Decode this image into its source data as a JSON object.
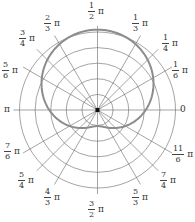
{
  "diagram": {
    "type": "polar-plot",
    "center": [
      97.5,
      110
    ],
    "ring_count": 5,
    "outer_radius_px": 78,
    "curve_color": "#8c8c8c",
    "grid_color": "#555555",
    "curve": "r = 3 + 2 sin θ"
  },
  "labels": {
    "a0": {
      "plain": "0"
    },
    "a1": {
      "num": "1",
      "den": "6",
      "pi": "π"
    },
    "a2": {
      "num": "1",
      "den": "4",
      "pi": "π"
    },
    "a3": {
      "num": "1",
      "den": "3",
      "pi": "π"
    },
    "a4": {
      "num": "1",
      "den": "2",
      "pi": "π"
    },
    "a5": {
      "num": "2",
      "den": "3",
      "pi": "π"
    },
    "a6": {
      "num": "3",
      "den": "4",
      "pi": "π"
    },
    "a7": {
      "num": "5",
      "den": "6",
      "pi": "π"
    },
    "a8": {
      "plain": "π"
    },
    "a9": {
      "num": "7",
      "den": "6",
      "pi": "π"
    },
    "a10": {
      "num": "5",
      "den": "4",
      "pi": "π"
    },
    "a11": {
      "num": "4",
      "den": "3",
      "pi": "π"
    },
    "a12": {
      "num": "3",
      "den": "2",
      "pi": "π"
    },
    "a13": {
      "num": "5",
      "den": "3",
      "pi": "π"
    },
    "a14": {
      "num": "7",
      "den": "4",
      "pi": "π"
    },
    "a15": {
      "num": "11",
      "den": "6",
      "pi": "π"
    }
  }
}
